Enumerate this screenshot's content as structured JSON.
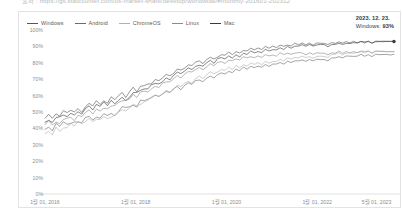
{
  "top_caption": {
    "text": "출처 : https://gs.statcounter.com/os-market-share/desktop/worldwide/#monthly-201601-202312"
  },
  "legend": {
    "items": [
      {
        "label": "Windows",
        "color": "#555555"
      },
      {
        "label": "Android",
        "color": "#6b6b6b"
      },
      {
        "label": "ChromeOS",
        "color": "#b0b0b0"
      },
      {
        "label": "Linux",
        "color": "#8a8a8a"
      },
      {
        "label": "Mac",
        "color": "#3a3a3a"
      }
    ]
  },
  "annotation": {
    "date": "2023. 12. 23.",
    "series_name": "Windows:",
    "value": "93%"
  },
  "chart_data": {
    "type": "line",
    "title": "",
    "xlabel": "",
    "ylabel": "",
    "ylim": [
      0,
      100
    ],
    "ytick_labels": [
      "100%",
      "90%",
      "80%",
      "70%",
      "60%",
      "50%",
      "40%",
      "30%",
      "20%",
      "10%",
      "0%"
    ],
    "ytick_values": [
      100,
      90,
      80,
      70,
      60,
      50,
      40,
      30,
      20,
      10,
      0
    ],
    "xtick_labels": [
      "1월 01, 2016",
      "1월 01, 2018",
      "1월 01, 2020",
      "1월 01, 2022",
      "5월 01, 2023"
    ],
    "xtick_positions": [
      0.0,
      0.26,
      0.52,
      0.78,
      0.95
    ],
    "grid": false,
    "legend_position": "top-left",
    "x": [
      0,
      1,
      2,
      3,
      4,
      5,
      6,
      7,
      8,
      9,
      10,
      11,
      12,
      13,
      14,
      15,
      16,
      17,
      18,
      19,
      20,
      21,
      22,
      23,
      24,
      25,
      26,
      27,
      28,
      29,
      30,
      31,
      32,
      33,
      34,
      35,
      36,
      37,
      38,
      39,
      40,
      41,
      42,
      43,
      44,
      45,
      46,
      47,
      48,
      49,
      50,
      51,
      52,
      53,
      54,
      55,
      56,
      57,
      58,
      59,
      60,
      61,
      62,
      63,
      64,
      65,
      66,
      67,
      68,
      69,
      70,
      71,
      72,
      73,
      74,
      75,
      76,
      77,
      78,
      79,
      80,
      81,
      82,
      83,
      84,
      85,
      86,
      87,
      88,
      89,
      90,
      91,
      92,
      93,
      94,
      95
    ],
    "series": [
      {
        "name": "Windows",
        "color": "#555555",
        "end_value": 93,
        "values": [
          47,
          48,
          46,
          49,
          48,
          50,
          49,
          51,
          50,
          52,
          51,
          53,
          55,
          54,
          56,
          55,
          57,
          56,
          58,
          57,
          59,
          61,
          60,
          62,
          64,
          63,
          65,
          67,
          66,
          68,
          70,
          69,
          71,
          73,
          72,
          74,
          76,
          75,
          77,
          79,
          78,
          80,
          81,
          80,
          82,
          83,
          82,
          84,
          85,
          84,
          86,
          85,
          87,
          86,
          88,
          87,
          89,
          88,
          89,
          88,
          90,
          89,
          90,
          89,
          91,
          90,
          91,
          90,
          92,
          91,
          92,
          91,
          92,
          91,
          92,
          92,
          92,
          91,
          92,
          92,
          93,
          92,
          93,
          92,
          93,
          92,
          93,
          93,
          93,
          92,
          93,
          93,
          93,
          93,
          93,
          93
        ]
      },
      {
        "name": "Mac",
        "color": "#3a3a3a",
        "end_value": 93,
        "values": [
          45,
          46,
          44,
          47,
          46,
          48,
          47,
          49,
          48,
          50,
          49,
          51,
          53,
          52,
          54,
          53,
          55,
          54,
          56,
          55,
          57,
          59,
          58,
          60,
          62,
          61,
          63,
          65,
          64,
          66,
          68,
          67,
          69,
          71,
          70,
          72,
          74,
          73,
          75,
          77,
          76,
          78,
          79,
          78,
          80,
          81,
          80,
          82,
          83,
          82,
          84,
          83,
          85,
          84,
          86,
          85,
          87,
          86,
          87,
          86,
          88,
          87,
          88,
          88,
          89,
          88,
          90,
          89,
          90,
          90,
          91,
          90,
          91,
          90,
          91,
          91,
          91,
          90,
          91,
          91,
          92,
          91,
          92,
          92,
          92,
          92,
          93,
          92,
          93,
          92,
          93,
          93,
          93,
          93,
          93,
          93
        ]
      },
      {
        "name": "Android",
        "color": "#6b6b6b",
        "end_value": 85,
        "values": [
          40,
          41,
          39,
          42,
          41,
          43,
          42,
          44,
          43,
          45,
          44,
          46,
          47,
          46,
          48,
          47,
          49,
          48,
          50,
          49,
          51,
          53,
          52,
          54,
          55,
          54,
          56,
          58,
          57,
          59,
          60,
          59,
          61,
          63,
          62,
          64,
          65,
          64,
          66,
          68,
          67,
          69,
          70,
          69,
          71,
          72,
          71,
          73,
          74,
          73,
          75,
          74,
          76,
          75,
          77,
          76,
          78,
          77,
          78,
          77,
          79,
          78,
          79,
          79,
          80,
          79,
          81,
          80,
          81,
          81,
          82,
          81,
          82,
          81,
          82,
          82,
          82,
          81,
          83,
          83,
          84,
          83,
          84,
          84,
          84,
          84,
          85,
          84,
          85,
          84,
          85,
          85,
          85,
          85,
          85,
          85
        ]
      },
      {
        "name": "Linux",
        "color": "#8a8a8a",
        "end_value": 85,
        "values": [
          43,
          44,
          42,
          45,
          44,
          46,
          45,
          47,
          46,
          48,
          47,
          49,
          51,
          50,
          52,
          51,
          53,
          52,
          54,
          53,
          55,
          57,
          56,
          58,
          60,
          59,
          61,
          63,
          62,
          64,
          66,
          65,
          67,
          69,
          68,
          70,
          72,
          71,
          73,
          75,
          74,
          76,
          77,
          76,
          78,
          79,
          78,
          80,
          81,
          80,
          82,
          81,
          83,
          82,
          84,
          83,
          84,
          83,
          84,
          83,
          85,
          84,
          85,
          84,
          86,
          85,
          86,
          85,
          86,
          86,
          86,
          85,
          86,
          85,
          86,
          86,
          86,
          85,
          86,
          86,
          87,
          86,
          87,
          86,
          87,
          86,
          87,
          87,
          87,
          86,
          87,
          87,
          87,
          87,
          87,
          87
        ]
      },
      {
        "name": "ChromeOS",
        "color": "#b0b0b0",
        "end_value": 87,
        "values": [
          38,
          39,
          37,
          40,
          39,
          41,
          40,
          42,
          41,
          43,
          42,
          44,
          45,
          44,
          46,
          45,
          47,
          46,
          48,
          47,
          49,
          51,
          50,
          52,
          54,
          53,
          55,
          57,
          56,
          58,
          60,
          59,
          61,
          63,
          62,
          64,
          66,
          65,
          67,
          69,
          68,
          70,
          72,
          71,
          73,
          74,
          73,
          75,
          76,
          75,
          77,
          76,
          78,
          77,
          79,
          78,
          80,
          79,
          80,
          79,
          81,
          80,
          81,
          81,
          82,
          81,
          83,
          82,
          83,
          83,
          84,
          83,
          84,
          83,
          84,
          84,
          84,
          83,
          85,
          85,
          86,
          85,
          86,
          86,
          86,
          86,
          87,
          86,
          87,
          86,
          87,
          87,
          87,
          87,
          87,
          87
        ]
      }
    ]
  }
}
